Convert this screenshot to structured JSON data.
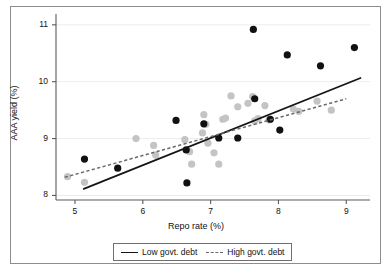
{
  "chart_data": {
    "type": "scatter",
    "title": "",
    "xlabel": "Repo rate (%)",
    "ylabel": "AAA yield (%)",
    "xlim": [
      4.72,
      9.35
    ],
    "ylim": [
      7.92,
      11.12
    ],
    "xticks": [
      5,
      6,
      7,
      8,
      9
    ],
    "yticks": [
      8,
      9,
      10,
      11
    ],
    "xtick_labels": [
      "5",
      "6",
      "7",
      "8",
      "9"
    ],
    "ytick_labels": [
      "8",
      "9",
      "10",
      "11"
    ],
    "grid": "horizontal-gridlines-at-yticks",
    "legend_position": "below-axis-centered",
    "series": [
      {
        "name": "Low govt. debt",
        "marker": "filled-circle",
        "color": "#111111",
        "points": [
          [
            5.14,
            8.64
          ],
          [
            5.63,
            8.48
          ],
          [
            6.49,
            9.32
          ],
          [
            6.64,
            8.8
          ],
          [
            6.65,
            8.22
          ],
          [
            6.9,
            9.26
          ],
          [
            7.12,
            9.01
          ],
          [
            7.4,
            9.01
          ],
          [
            7.63,
            10.92
          ],
          [
            7.65,
            9.7
          ],
          [
            7.88,
            9.34
          ],
          [
            8.02,
            9.15
          ],
          [
            8.13,
            10.47
          ],
          [
            8.62,
            10.28
          ],
          [
            9.12,
            10.6
          ]
        ]
      },
      {
        "name": "High govt. debt",
        "marker": "filled-circle",
        "color": "#c4c4c4",
        "points": [
          [
            4.89,
            8.33
          ],
          [
            5.14,
            8.23
          ],
          [
            5.9,
            9.0
          ],
          [
            6.16,
            8.88
          ],
          [
            6.19,
            8.71
          ],
          [
            6.62,
            8.98
          ],
          [
            6.69,
            8.77
          ],
          [
            6.72,
            8.55
          ],
          [
            6.88,
            9.1
          ],
          [
            6.9,
            9.42
          ],
          [
            6.93,
            9.25
          ],
          [
            6.96,
            8.92
          ],
          [
            7.05,
            8.75
          ],
          [
            7.12,
            8.55
          ],
          [
            7.18,
            9.34
          ],
          [
            7.22,
            9.36
          ],
          [
            7.3,
            9.75
          ],
          [
            7.4,
            9.56
          ],
          [
            7.55,
            9.62
          ],
          [
            7.62,
            9.74
          ],
          [
            7.65,
            9.31
          ],
          [
            7.7,
            9.35
          ],
          [
            7.8,
            9.58
          ],
          [
            7.86,
            9.33
          ],
          [
            8.22,
            9.52
          ],
          [
            8.3,
            9.48
          ],
          [
            8.57,
            9.66
          ],
          [
            8.78,
            9.5
          ]
        ]
      }
    ],
    "trendlines": [
      {
        "name": "Low govt. debt",
        "style": "solid",
        "color": "#151515",
        "x0": 5.12,
        "y0": 8.11,
        "x1": 9.22,
        "y1": 10.07
      },
      {
        "name": "High govt. debt",
        "style": "dashed",
        "color": "#6a6a6a",
        "x0": 4.85,
        "y0": 8.32,
        "x1": 9.0,
        "y1": 9.7
      }
    ]
  },
  "legend": {
    "items": [
      {
        "label": "Low govt. debt",
        "style": "solid"
      },
      {
        "label": "High govt. debt",
        "style": "dashed"
      }
    ]
  }
}
